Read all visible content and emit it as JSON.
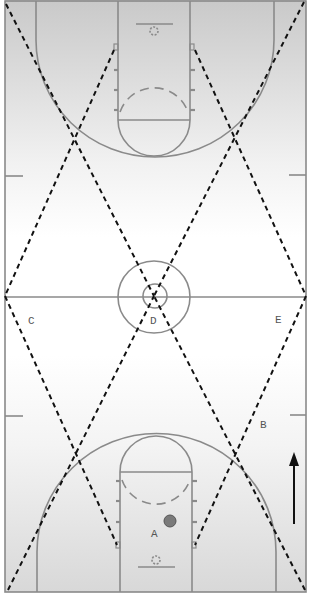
{
  "diagram": {
    "type": "basketball-court-drill",
    "orientation": "vertical",
    "colors": {
      "court_line": "#8a8a8a",
      "dashed_path": "#111111",
      "gradient_top": "#cfcfcf",
      "gradient_mid": "#ffffff",
      "ball": "#7a7a7a",
      "arrow": "#111111",
      "label_text": "#555555"
    },
    "labels": {
      "a": "A",
      "b": "B",
      "c": "C",
      "d": "D",
      "e": "E"
    },
    "arrow": {
      "direction": "up"
    },
    "ball": {
      "present": true
    }
  }
}
